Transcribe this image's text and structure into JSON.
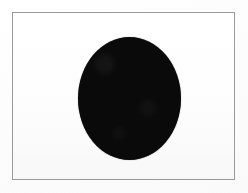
{
  "figure": {
    "caption": "",
    "page_background_color": "#ffffff",
    "frame": {
      "name": "figure-border",
      "border_color": "#9a9a9a",
      "border_width_px": 1,
      "fill_color": "#fdfdfd",
      "left_px": 12,
      "top_px": 12,
      "width_px": 223,
      "height_px": 168
    },
    "shapes": [
      {
        "name": "black-ellipse",
        "type": "ellipse",
        "fill_color": "#0a0a0a",
        "center_x_px": 129,
        "center_y_px": 98,
        "width_px": 103,
        "height_px": 123,
        "label": ""
      }
    ]
  },
  "chart_data": {
    "type": "scatter",
    "title": "",
    "xlabel": "",
    "ylabel": "",
    "grid": false,
    "legend": "none",
    "xlim": [
      0,
      248
    ],
    "ylim": [
      0,
      193
    ],
    "series": [
      {
        "name": "black-ellipse",
        "marker": "filled-ellipse",
        "color": "#0a0a0a",
        "x": [
          129
        ],
        "y": [
          98
        ],
        "width": [
          103
        ],
        "height": [
          123
        ]
      }
    ]
  }
}
